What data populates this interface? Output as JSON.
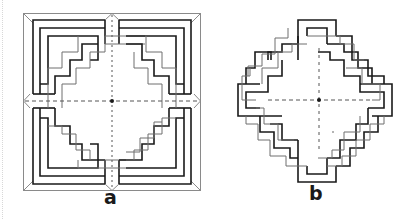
{
  "figures": [
    {
      "id": "a",
      "label": "a",
      "description": "Square interlaced key-pattern knot inside a bevelled square frame, divided into four quadrants by dashed axes with a center dot"
    },
    {
      "id": "b",
      "label": "b",
      "description": "Stepped diamond interlaced knot pattern with dashed axes and center dot"
    }
  ],
  "colors": {
    "dark_stroke": "#1a1a1a",
    "light_stroke": "#6e6e6e",
    "frame_stroke": "#8a8a8a",
    "dash": "#555555",
    "background": "#ffffff"
  }
}
